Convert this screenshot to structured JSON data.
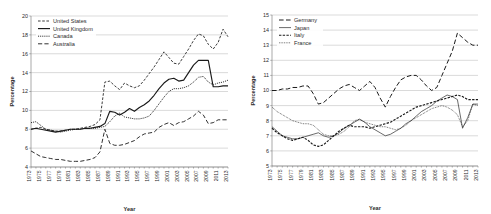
{
  "figure": {
    "panels": [
      "left",
      "right"
    ]
  },
  "chart_data": [
    {
      "type": "line",
      "panel": "left",
      "title": "",
      "xlabel": "Year",
      "ylabel": "Percentage",
      "xlim": [
        1973,
        2013
      ],
      "ylim": [
        4,
        20
      ],
      "ytick_step": 2,
      "xtick_step": 2,
      "grid": true,
      "legend_position": "top-left",
      "yticks": [
        4,
        6,
        8,
        10,
        12,
        14,
        16,
        18,
        20
      ],
      "xticks": [
        1973,
        1975,
        1977,
        1979,
        1981,
        1983,
        1985,
        1987,
        1989,
        1991,
        1993,
        1995,
        1997,
        1999,
        2001,
        2003,
        2005,
        2007,
        2009,
        2011,
        2013
      ],
      "x": [
        1973,
        1974,
        1975,
        1976,
        1977,
        1978,
        1979,
        1980,
        1981,
        1982,
        1983,
        1984,
        1985,
        1986,
        1987,
        1988,
        1989,
        1990,
        1991,
        1992,
        1993,
        1994,
        1995,
        1996,
        1997,
        1998,
        1999,
        2000,
        2001,
        2002,
        2003,
        2004,
        2005,
        2006,
        2007,
        2008,
        2009,
        2010,
        2011,
        2012,
        2013
      ],
      "series": [
        {
          "name": "United States",
          "style": "dashed",
          "values": [
            8.0,
            8.1,
            8.2,
            8.0,
            7.9,
            7.8,
            7.8,
            7.9,
            8.0,
            8.0,
            8.1,
            8.2,
            8.3,
            8.5,
            9.0,
            13.0,
            13.1,
            12.6,
            12.2,
            12.9,
            12.6,
            12.4,
            12.6,
            13.2,
            13.9,
            14.6,
            15.4,
            16.2,
            15.6,
            15.0,
            14.9,
            15.7,
            16.5,
            17.4,
            18.1,
            17.9,
            17.0,
            16.5,
            17.2,
            18.6,
            17.8
          ]
        },
        {
          "name": "United Kingdom",
          "style": "solid",
          "values": [
            8.0,
            8.1,
            8.0,
            7.9,
            7.8,
            7.7,
            7.8,
            7.9,
            8.0,
            8.0,
            8.0,
            8.1,
            8.1,
            8.2,
            8.3,
            8.6,
            9.9,
            9.8,
            9.5,
            9.8,
            10.2,
            9.9,
            10.3,
            10.6,
            11.0,
            11.6,
            12.3,
            12.9,
            13.3,
            13.4,
            13.1,
            13.2,
            14.0,
            14.8,
            15.3,
            15.3,
            15.3,
            12.5,
            12.5,
            12.6,
            12.6
          ]
        },
        {
          "name": "Canada",
          "style": "dotted",
          "values": [
            8.7,
            8.8,
            8.4,
            8.0,
            7.9,
            7.8,
            7.7,
            7.8,
            7.9,
            8.0,
            8.0,
            8.1,
            8.1,
            8.1,
            8.2,
            8.3,
            8.8,
            9.4,
            9.7,
            9.3,
            9.2,
            9.1,
            9.1,
            9.2,
            9.4,
            10.0,
            10.7,
            11.4,
            12.0,
            12.3,
            12.3,
            12.4,
            12.6,
            13.0,
            13.5,
            13.6,
            13.0,
            12.7,
            12.9,
            13.0,
            13.2
          ]
        },
        {
          "name": "Australia",
          "style": "dashdot",
          "values": [
            5.7,
            5.4,
            5.1,
            5.0,
            4.9,
            4.8,
            4.8,
            4.7,
            4.6,
            4.6,
            4.6,
            4.7,
            4.8,
            5.0,
            5.6,
            8.0,
            6.5,
            6.3,
            6.3,
            6.4,
            6.6,
            6.8,
            7.2,
            7.5,
            7.6,
            7.7,
            8.2,
            8.5,
            8.7,
            8.4,
            8.7,
            8.8,
            9.1,
            9.4,
            9.9,
            9.5,
            8.6,
            8.7,
            9.0,
            9.0,
            9.0
          ]
        }
      ]
    },
    {
      "type": "line",
      "panel": "right",
      "title": "",
      "xlabel": "Year",
      "ylabel": "Percentage",
      "xlim": [
        1973,
        2013
      ],
      "ylim": [
        5,
        15
      ],
      "ytick_step": 1,
      "xtick_step": 2,
      "grid": true,
      "legend_position": "top-left",
      "yticks": [
        5,
        6,
        7,
        8,
        9,
        10,
        11,
        12,
        13,
        14,
        15
      ],
      "xticks": [
        1973,
        1975,
        1977,
        1979,
        1981,
        1983,
        1985,
        1987,
        1989,
        1991,
        1993,
        1995,
        1997,
        1999,
        2001,
        2003,
        2005,
        2007,
        2009,
        2011,
        2013
      ],
      "x": [
        1973,
        1974,
        1975,
        1976,
        1977,
        1978,
        1979,
        1980,
        1981,
        1982,
        1983,
        1984,
        1985,
        1986,
        1987,
        1988,
        1989,
        1990,
        1991,
        1992,
        1993,
        1994,
        1995,
        1996,
        1997,
        1998,
        1999,
        2000,
        2001,
        2002,
        2003,
        2004,
        2005,
        2006,
        2007,
        2008,
        2009,
        2010,
        2011,
        2012,
        2013
      ],
      "series": [
        {
          "name": "Germany",
          "style": "longdash",
          "values": [
            10.0,
            10.0,
            10.1,
            10.1,
            10.2,
            10.2,
            10.3,
            10.3,
            9.8,
            9.1,
            9.2,
            9.5,
            9.8,
            10.1,
            10.3,
            10.4,
            10.2,
            10.0,
            10.3,
            10.6,
            10.2,
            9.5,
            8.9,
            9.6,
            10.2,
            10.7,
            10.9,
            11.0,
            11.0,
            10.7,
            10.3,
            10.0,
            10.2,
            11.0,
            11.8,
            12.6,
            13.8,
            13.5,
            13.2,
            13.0,
            13.0
          ]
        },
        {
          "name": "Japan",
          "style": "thin-solid",
          "values": [
            7.6,
            7.3,
            7.0,
            6.9,
            6.8,
            6.8,
            6.9,
            7.0,
            7.1,
            7.2,
            7.0,
            6.9,
            7.0,
            7.2,
            7.5,
            7.7,
            7.9,
            8.1,
            7.9,
            7.6,
            7.4,
            7.2,
            7.0,
            7.1,
            7.3,
            7.5,
            7.8,
            8.0,
            8.3,
            8.6,
            8.8,
            9.0,
            9.3,
            9.5,
            9.7,
            9.6,
            9.4,
            7.5,
            8.2,
            9.1,
            9.1
          ]
        },
        {
          "name": "Italy",
          "style": "bold-dashed",
          "values": [
            7.5,
            7.2,
            7.0,
            6.8,
            6.7,
            6.8,
            6.9,
            6.7,
            6.4,
            6.3,
            6.4,
            6.7,
            7.0,
            7.3,
            7.5,
            7.7,
            7.6,
            7.6,
            7.6,
            7.5,
            7.6,
            7.7,
            7.8,
            7.9,
            8.1,
            8.3,
            8.5,
            8.7,
            8.9,
            9.0,
            9.1,
            9.2,
            9.3,
            9.4,
            9.5,
            9.6,
            9.7,
            9.6,
            9.4,
            9.4,
            9.4
          ]
        },
        {
          "name": "France",
          "style": "fine-dotted",
          "values": [
            8.9,
            8.6,
            8.4,
            8.2,
            8.0,
            7.9,
            7.8,
            7.8,
            7.7,
            7.4,
            7.1,
            7.0,
            7.0,
            7.1,
            7.3,
            7.6,
            8.0,
            8.1,
            7.9,
            7.8,
            7.7,
            7.6,
            7.6,
            7.5,
            7.4,
            7.5,
            7.7,
            8.0,
            8.2,
            8.4,
            8.6,
            8.8,
            8.9,
            9.0,
            8.9,
            8.7,
            8.4,
            7.6,
            8.0,
            9.1,
            9.0
          ]
        }
      ]
    }
  ]
}
